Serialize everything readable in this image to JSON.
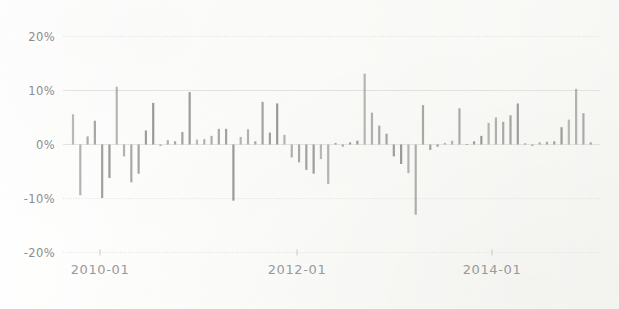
{
  "figure": {
    "background_color": "#fdfdfb",
    "bar_color": "#8f8f8f",
    "grid_color": "#d8d8d6",
    "tick_text_color": "#8d8d8d"
  },
  "chart_data": {
    "type": "bar",
    "title": "",
    "subtitle": "",
    "xlabel": "",
    "ylabel": "",
    "ylim": [
      -20,
      20
    ],
    "grid": true,
    "legend": null,
    "annotations": [],
    "y_ticks": [
      20,
      10,
      0,
      -10,
      -20
    ],
    "y_tick_labels": [
      "20%",
      "10%",
      "0%",
      "-10%",
      "-20%"
    ],
    "x_ticks": [
      "2010-01",
      "2012-01",
      "2014-01"
    ],
    "x_tick_labels": [
      "2010-01",
      "2012-01",
      "2014-01"
    ],
    "x_tick_positions": [
      100,
      297,
      492
    ],
    "x_range": [
      "2009-09",
      "2015-09"
    ],
    "series_name": "monthly return",
    "categories": [
      "2009-09",
      "2009-10",
      "2009-11",
      "2009-12",
      "2010-01",
      "2010-02",
      "2010-03",
      "2010-04",
      "2010-05",
      "2010-06",
      "2010-07",
      "2010-08",
      "2010-09",
      "2010-10",
      "2010-11",
      "2010-12",
      "2011-01",
      "2011-02",
      "2011-03",
      "2011-04",
      "2011-05",
      "2011-06",
      "2011-07",
      "2011-08",
      "2011-09",
      "2011-10",
      "2011-11",
      "2011-12",
      "2012-01",
      "2012-02",
      "2012-03",
      "2012-04",
      "2012-05",
      "2012-06",
      "2012-07",
      "2012-08",
      "2012-09",
      "2012-10",
      "2012-11",
      "2012-12",
      "2013-01",
      "2013-02",
      "2013-03",
      "2013-04",
      "2013-05",
      "2013-06",
      "2013-07",
      "2013-08",
      "2013-09",
      "2013-10",
      "2013-11",
      "2013-12",
      "2014-01",
      "2014-02",
      "2014-03",
      "2014-04",
      "2014-05",
      "2014-06",
      "2014-07",
      "2014-08",
      "2014-09",
      "2014-10",
      "2014-11",
      "2014-12",
      "2015-01",
      "2015-02",
      "2015-03",
      "2015-04",
      "2015-05",
      "2015-06",
      "2015-07",
      "2015-08"
    ],
    "values": [
      5.6,
      -9.4,
      1.5,
      4.4,
      -9.9,
      -6.2,
      10.7,
      -2.2,
      -7.0,
      -5.4,
      2.6,
      7.7,
      -0.3,
      0.8,
      0.6,
      2.3,
      9.7,
      0.9,
      1.0,
      1.6,
      2.9,
      2.9,
      -10.4,
      1.4,
      2.8,
      0.6,
      7.9,
      2.2,
      7.6,
      1.8,
      -2.4,
      -3.3,
      -4.7,
      -5.4,
      -2.7,
      -7.3,
      0.3,
      -0.4,
      0.4,
      0.7,
      13.1,
      5.9,
      3.5,
      2.0,
      -2.2,
      -3.6,
      -5.3,
      -13.0,
      7.3,
      -1.0,
      -0.4,
      0.3,
      0.7,
      6.7,
      0.1,
      0.6,
      1.6,
      4.0,
      5.0,
      4.2,
      5.4,
      7.6,
      0.2,
      -0.3,
      0.4,
      0.5,
      0.6,
      3.2,
      4.6,
      10.3,
      5.8,
      0.4
    ]
  }
}
